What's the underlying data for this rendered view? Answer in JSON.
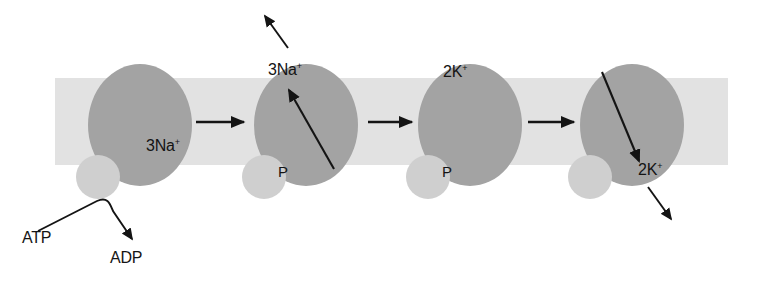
{
  "figure": {
    "type": "diagram",
    "background_color": "#ffffff",
    "membrane": {
      "name": "lipid-membrane-band",
      "color": "#e2e2e2",
      "x": 55,
      "y": 78,
      "width": 673,
      "height": 87
    },
    "colors": {
      "pump_protein": "#a3a3a3",
      "phosphate": "#cfcfcf",
      "membrane": "#e2e2e2",
      "ink": "#141414"
    }
  },
  "stages": [
    {
      "id": "stage-1",
      "pump": {
        "cx": 140,
        "cy": 125,
        "rx": 52,
        "ry": 61
      },
      "phosphate": {
        "cx": 98,
        "cy": 177,
        "r": 22,
        "label": ""
      },
      "label": "3Na",
      "charge": "+",
      "label_x": 146,
      "label_y": 145
    },
    {
      "id": "stage-2",
      "pump": {
        "cx": 306,
        "cy": 125,
        "rx": 52,
        "ry": 61
      },
      "phosphate": {
        "cx": 264,
        "cy": 177,
        "r": 22,
        "label": "P"
      },
      "label": "3Na",
      "charge": "+",
      "label_x": 268,
      "label_y": 70
    },
    {
      "id": "stage-3",
      "pump": {
        "cx": 470,
        "cy": 125,
        "rx": 52,
        "ry": 61
      },
      "phosphate": {
        "cx": 428,
        "cy": 177,
        "r": 22,
        "label": "P"
      },
      "label": "2K",
      "charge": "+",
      "label_x": 443,
      "label_y": 72
    },
    {
      "id": "stage-4",
      "pump": {
        "cx": 632,
        "cy": 125,
        "rx": 52,
        "ry": 61
      },
      "phosphate": {
        "cx": 590,
        "cy": 177,
        "r": 22,
        "label": ""
      },
      "label": "2K",
      "charge": "+",
      "label_x": 638,
      "label_y": 170
    }
  ],
  "labels": {
    "na_ion": "3Na",
    "k_ion": "2K",
    "charge_sign": "+",
    "phosphate": "P",
    "atp": "ATP",
    "adp": "ADP"
  },
  "arrows": {
    "step_arrows": [
      {
        "name": "stage-1-to-2",
        "x1": 196,
        "y1": 122,
        "x2": 246,
        "y2": 122
      },
      {
        "name": "stage-2-to-3",
        "x1": 368,
        "y1": 122,
        "x2": 414,
        "y2": 122
      },
      {
        "name": "stage-3-to-4",
        "x1": 528,
        "y1": 122,
        "x2": 576,
        "y2": 122
      }
    ],
    "na_exit": {
      "name": "sodium-exit-arrow",
      "x1": 287,
      "y1": 47,
      "x2": 263,
      "y2": 13
    },
    "na_transport": {
      "name": "sodium-transport-arrow",
      "x1": 333,
      "y1": 168,
      "x2": 288,
      "y2": 88
    },
    "k_transport": {
      "name": "potassium-transport-arrow",
      "x1": 603,
      "y1": 73,
      "x2": 640,
      "y2": 163
    },
    "k_release": {
      "name": "potassium-release-arrow",
      "x1": 649,
      "y1": 188,
      "x2": 672,
      "y2": 221
    },
    "atp_curve": {
      "name": "atp-to-adp-arrow",
      "path": "M 38 231 L 98 201 C 108 197 111 203 114 210 L 134 241",
      "tip_x": 135,
      "tip_y": 243
    }
  },
  "text_positions": {
    "atp": {
      "x": 22,
      "y": 238
    },
    "adp": {
      "x": 110,
      "y": 258
    }
  }
}
